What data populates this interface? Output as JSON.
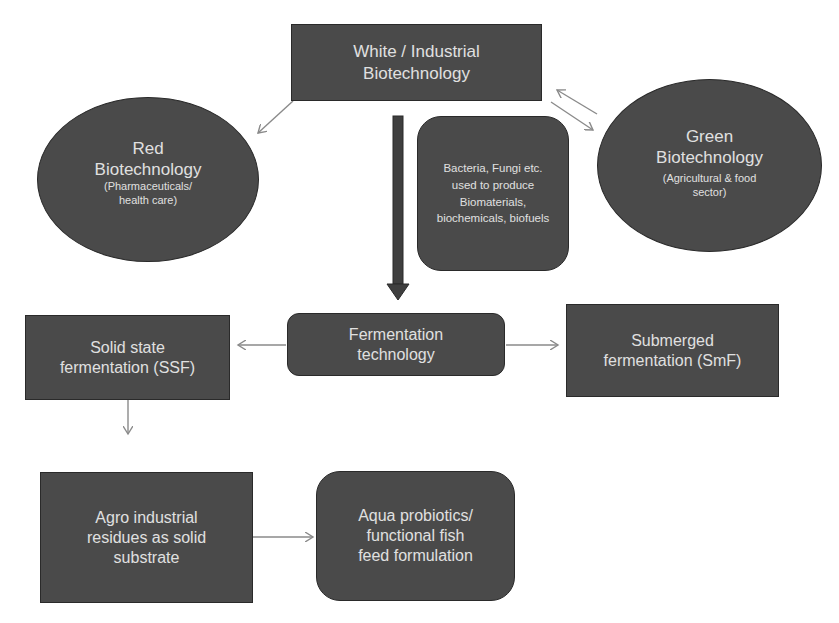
{
  "diagram": {
    "nodes": {
      "white": {
        "title": "White / Industrial",
        "subtitle": "Biotechnology"
      },
      "red": {
        "title": "Red",
        "title2": "Biotechnology",
        "note1": "(Pharmaceuticals/",
        "note2": "health care)"
      },
      "green": {
        "title": "Green",
        "title2": "Biotechnology",
        "note1": "(Agricultural & food",
        "note2": "sector)"
      },
      "microbes": {
        "line1": "Bacteria, Fungi etc.",
        "line2": "used to produce",
        "line3": "Biomaterials,",
        "line4": "biochemicals, biofuels"
      },
      "fermentation": {
        "line1": "Fermentation",
        "line2": "technology"
      },
      "ssf": {
        "line1": "Solid state",
        "line2": "fermentation (SSF)"
      },
      "smf": {
        "line1": "Submerged",
        "line2": "fermentation (SmF)"
      },
      "agro": {
        "line1": "Agro industrial",
        "line2": "residues as solid",
        "line3": "substrate"
      },
      "aqua": {
        "line1": "Aqua probiotics/",
        "line2": "functional fish",
        "line3": "feed formulation"
      }
    },
    "edges": [
      {
        "from": "white",
        "to": "red"
      },
      {
        "from": "white",
        "to": "green",
        "bidirectional": true
      },
      {
        "from": "white",
        "to": "fermentation",
        "style": "thick"
      },
      {
        "from": "fermentation",
        "to": "ssf"
      },
      {
        "from": "fermentation",
        "to": "smf"
      },
      {
        "from": "ssf",
        "to": "agro"
      },
      {
        "from": "agro",
        "to": "aqua"
      }
    ],
    "colors": {
      "node_fill": "#4a4a4a",
      "node_text": "#e0e0e0",
      "arrow": "#8a8a8a",
      "thick_arrow": "#3a3a3a"
    }
  }
}
